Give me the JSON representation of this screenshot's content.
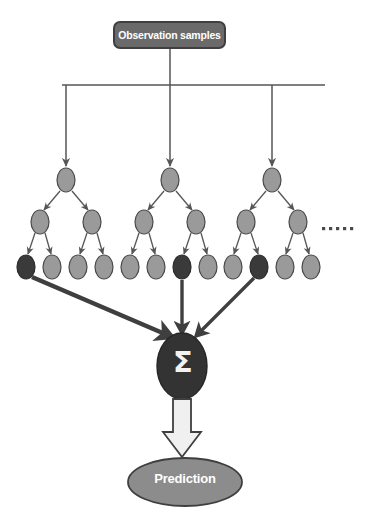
{
  "diagram": {
    "title_box": {
      "label": "Observation samples",
      "fill": "#6a6a6a",
      "stroke": "#3f3f3f",
      "text_color": "#ffffff"
    },
    "aggregator": {
      "symbol": "Σ",
      "name": "sum-aggregator",
      "fill": "#333333",
      "text_color": "#f2f2f2"
    },
    "output": {
      "label": "Prediction",
      "fill": "#8c8c8c",
      "stroke": "#3f3f3f",
      "text_color": "#ffffff"
    },
    "ellipsis": {
      "label": "• • • • •",
      "dot_count": 5,
      "meaning": "more trees"
    },
    "colors": {
      "node_light": "#9a9a9a",
      "node_dark": "#3a3a3a",
      "node_stroke": "#4a4a4a",
      "connector": "#555555",
      "thick_arrow": "#3f3f3f",
      "block_arrow_fill": "#f0f0f0",
      "block_arrow_stroke": "#3f3f3f",
      "background": "#ffffff"
    },
    "bus": {
      "name": "distribution-bus",
      "y": 85,
      "x_start": 62,
      "x_end": 325
    },
    "trees": [
      {
        "name": "decision-tree-1",
        "root_x": 66,
        "internal_x": [
          40,
          92
        ],
        "leaves": [
          {
            "x": 26,
            "state": "selected"
          },
          {
            "x": 52,
            "state": "unselected"
          },
          {
            "x": 78,
            "state": "unselected"
          },
          {
            "x": 104,
            "state": "unselected"
          }
        ]
      },
      {
        "name": "decision-tree-2",
        "root_x": 170,
        "internal_x": [
          144,
          196
        ],
        "leaves": [
          {
            "x": 130,
            "state": "unselected"
          },
          {
            "x": 156,
            "state": "unselected"
          },
          {
            "x": 182,
            "state": "selected"
          },
          {
            "x": 208,
            "state": "unselected"
          }
        ]
      },
      {
        "name": "decision-tree-3",
        "root_x": 272,
        "internal_x": [
          246,
          298
        ],
        "leaves": [
          {
            "x": 233,
            "state": "unselected"
          },
          {
            "x": 259,
            "state": "selected"
          },
          {
            "x": 285,
            "state": "unselected"
          },
          {
            "x": 311,
            "state": "unselected"
          }
        ]
      }
    ],
    "levels": {
      "root_y": 180,
      "internal_y": 222,
      "leaf_y": 267
    }
  }
}
